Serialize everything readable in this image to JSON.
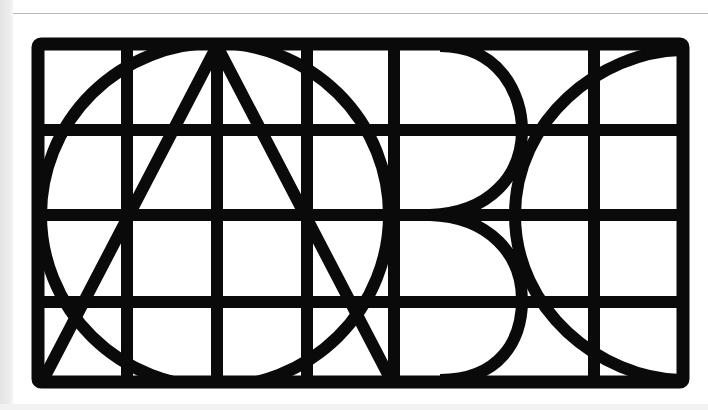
{
  "artwork": {
    "title": "ABC",
    "description": "Geometric letterform composition: circle, A triangle, B bowls and C arc overlaid on a rectangular grid",
    "colors": {
      "ink": "#0a0a0a",
      "paper": "#ffffff",
      "edge": "#e6e6e6"
    },
    "letters": [
      "A",
      "B",
      "C"
    ],
    "grid": {
      "columns_x": [
        40,
        127,
        217,
        307,
        394,
        594,
        681
      ],
      "rows_y": [
        46,
        130,
        215,
        302,
        380
      ]
    }
  }
}
